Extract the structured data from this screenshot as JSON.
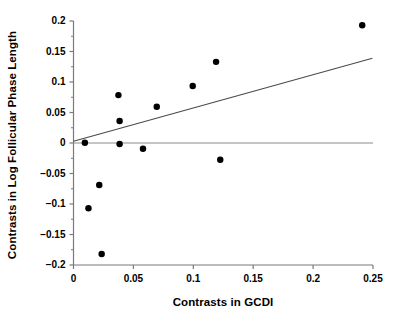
{
  "chart_data": {
    "type": "scatter",
    "title": "",
    "xlabel": "Contrasts in GCDI",
    "ylabel": "Contrasts in Log Follicular Phase Length",
    "xlim": [
      0,
      0.25
    ],
    "ylim": [
      -0.2,
      0.2
    ],
    "xticks": [
      0,
      0.05,
      0.1,
      0.15,
      0.2,
      0.25
    ],
    "xtick_labels": [
      "0",
      "0.05",
      "0.1",
      "0.15",
      "0.2",
      "0.25"
    ],
    "yticks": [
      0.2,
      0.15,
      0.1,
      0.05,
      0,
      -0.05,
      -0.1,
      -0.15,
      -0.2
    ],
    "ytick_labels": [
      "0.2",
      "0.15",
      "0.1",
      "0.05",
      "0",
      "−0.05",
      "−0.1",
      "−0.15",
      "−0.2"
    ],
    "grid": false,
    "legend": null,
    "marker_color": "#000000",
    "marker_size": 5,
    "axis_color": "#7a7a7a",
    "points": [
      {
        "x": 0.0095,
        "y": 0.0005
      },
      {
        "x": 0.0125,
        "y": -0.107
      },
      {
        "x": 0.0215,
        "y": -0.069
      },
      {
        "x": 0.0235,
        "y": -0.182
      },
      {
        "x": 0.0375,
        "y": 0.0785
      },
      {
        "x": 0.0385,
        "y": 0.036
      },
      {
        "x": 0.0385,
        "y": -0.0015
      },
      {
        "x": 0.058,
        "y": -0.0095
      },
      {
        "x": 0.0695,
        "y": 0.0595
      },
      {
        "x": 0.0995,
        "y": 0.0935
      },
      {
        "x": 0.119,
        "y": 0.133
      },
      {
        "x": 0.1225,
        "y": -0.0275
      },
      {
        "x": 0.241,
        "y": 0.193
      }
    ],
    "reference_line": {
      "name": "zero-line",
      "y": 0.0,
      "x_from": 0.0,
      "x_to": 0.25,
      "color": "#8c8c8c"
    },
    "fit_line": {
      "name": "regression-line",
      "x_from": 0.0,
      "x_to": 0.2495,
      "y_from": 0.003,
      "y_to": 0.139,
      "color": "#4a4a4a"
    }
  }
}
